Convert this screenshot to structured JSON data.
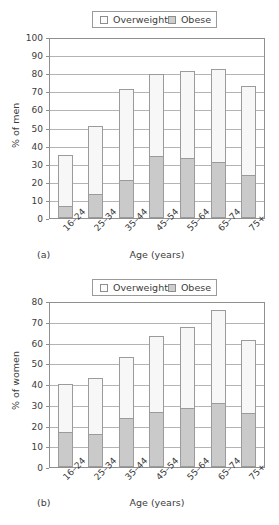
{
  "legend": {
    "overweight_label": "Overweight",
    "obese_label": "Obese",
    "overweight_icon": "square-outline-icon",
    "obese_icon": "square-filled-icon"
  },
  "colors": {
    "overweight_fill": "#f7f7f7",
    "obese_fill": "#cacaca",
    "bar_stroke": "#9b9b9b",
    "grid": "#b4b4b4",
    "axis": "#8f8f8f",
    "text": "#3c3c3c"
  },
  "panel_a": {
    "tag": "(a)",
    "xlabel": "Age (years)",
    "ylabel": "% of men"
  },
  "panel_b": {
    "tag": "(b)",
    "xlabel": "Age (years)",
    "ylabel": "% of women"
  },
  "chart_data": [
    {
      "type": "bar",
      "stacked": true,
      "title": "",
      "panel": "(a)",
      "xlabel": "Age (years)",
      "ylabel": "% of men",
      "ylim": [
        0,
        100
      ],
      "yticks": [
        0,
        10,
        20,
        30,
        40,
        50,
        60,
        70,
        80,
        90,
        100
      ],
      "grid": true,
      "legend_position": "top-center",
      "categories": [
        "16–24",
        "25–34",
        "35–44",
        "45–54",
        "55–64",
        "65–74",
        "75+"
      ],
      "series": [
        {
          "name": "Obese",
          "values": [
            6.5,
            13.5,
            21,
            34.5,
            33,
            31,
            23.5
          ]
        },
        {
          "name": "Overweight",
          "values": [
            28.5,
            37.5,
            50.5,
            45,
            48,
            51.5,
            49.5
          ]
        }
      ],
      "totals": [
        35,
        51,
        71.5,
        79.5,
        81,
        82.5,
        73
      ]
    },
    {
      "type": "bar",
      "stacked": true,
      "title": "",
      "panel": "(b)",
      "xlabel": "Age (years)",
      "ylabel": "% of women",
      "ylim": [
        0,
        80
      ],
      "yticks": [
        0,
        10,
        20,
        30,
        40,
        50,
        60,
        70,
        80
      ],
      "grid": true,
      "legend_position": "top-center",
      "categories": [
        "16–24",
        "25–34",
        "35–44",
        "45–54",
        "55–64",
        "65–74",
        "75+"
      ],
      "series": [
        {
          "name": "Obese",
          "values": [
            17,
            16,
            23.5,
            26.5,
            28.5,
            31,
            26
          ]
        },
        {
          "name": "Overweight",
          "values": [
            23,
            27,
            29.5,
            36.5,
            39,
            44.5,
            35
          ]
        }
      ],
      "totals": [
        40,
        43,
        53,
        63,
        67.5,
        75.5,
        61
      ]
    }
  ]
}
